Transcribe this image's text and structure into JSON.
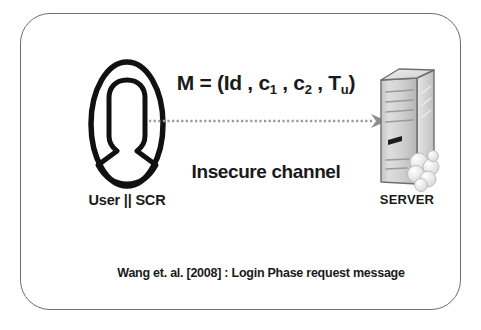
{
  "diagram": {
    "caption": "Wang et. al. [2008] : Login Phase request message",
    "frame_color": "#6d6e70",
    "background": "#ffffff",
    "text_color": "#1a1a1a"
  },
  "user": {
    "label": "User || SCR",
    "icon": "user-oval-icon",
    "icon_color": "#111111"
  },
  "server": {
    "label": "SERVER",
    "icon": "server-tower-icon",
    "icon_color": "#c9c9c9"
  },
  "channel": {
    "label": "Insecure channel",
    "arrow": "dotted-right-arrow-icon",
    "arrow_color": "#9a9a9a",
    "direction": "user-to-server"
  },
  "message": {
    "prefix": "M = (",
    "terms": [
      {
        "base": "Id",
        "sub": ""
      },
      {
        "base": "c",
        "sub": "1"
      },
      {
        "base": "c",
        "sub": "2"
      },
      {
        "base": "T",
        "sub": "u"
      }
    ],
    "separator": " , ",
    "suffix": ")",
    "full_text": "M = (Id , c1 , c2 , Tu)"
  }
}
